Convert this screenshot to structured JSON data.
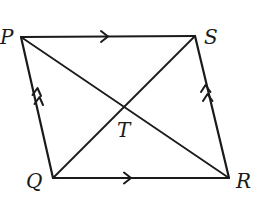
{
  "diagram": {
    "type": "parallelogram",
    "vertices": {
      "P": {
        "label": "P",
        "x": 21,
        "y": 37
      },
      "S": {
        "label": "S",
        "x": 195,
        "y": 36
      },
      "R": {
        "label": "R",
        "x": 229,
        "y": 178
      },
      "Q": {
        "label": "Q",
        "x": 53,
        "y": 178
      }
    },
    "intersection": {
      "label": "T",
      "x": 125,
      "y": 107
    },
    "sides": [
      {
        "from": "P",
        "to": "S",
        "arrow_marks": 1
      },
      {
        "from": "Q",
        "to": "R",
        "arrow_marks": 1
      },
      {
        "from": "Q",
        "to": "P",
        "arrow_marks": 2
      },
      {
        "from": "R",
        "to": "S",
        "arrow_marks": 2
      }
    ],
    "diagonals": [
      {
        "from": "P",
        "to": "R"
      },
      {
        "from": "Q",
        "to": "S"
      }
    ],
    "colors": {
      "stroke": "#1a1a1a",
      "background": "#ffffff"
    }
  }
}
